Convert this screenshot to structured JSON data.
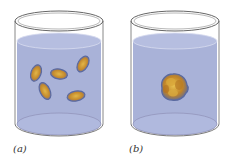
{
  "figure": {
    "panels": [
      {
        "id": "a",
        "label": "(a)",
        "description": "Beaker of liquid with five separated oval cells dispersed",
        "cell_count": 5,
        "state": "dispersed"
      },
      {
        "id": "b",
        "label": "(b)",
        "description": "Beaker of liquid with cells clumped into a single aggregate",
        "cell_count": 1,
        "state": "aggregated"
      }
    ]
  },
  "colors": {
    "liquid": "#a9b2d8",
    "liquid_top": "#b8c0e0",
    "glass_outline": "#6a6a6a",
    "cell_fill": "#c8902a",
    "cell_edge": "#5b6aa0",
    "cell_highlight": "#e0b040",
    "label": "#333333"
  }
}
